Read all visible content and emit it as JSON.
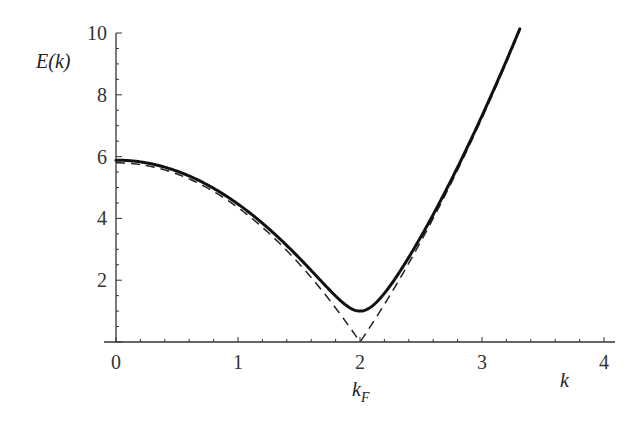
{
  "chart_data": {
    "type": "line",
    "title": "",
    "xlabel": "k",
    "ylabel": "E(k)",
    "xlim": [
      0,
      4
    ],
    "ylim": [
      0,
      10
    ],
    "x_ticks": [
      0,
      1,
      2,
      3,
      4
    ],
    "y_ticks": [
      2,
      4,
      6,
      8,
      10
    ],
    "x_minor_step": 0.2,
    "y_minor_step": 0.5,
    "annotations": [
      {
        "text": "k_F",
        "x": 2,
        "position": "below x-axis label 2"
      }
    ],
    "grid": false,
    "legend": null,
    "model": {
      "description": "Quasiparticle dispersion E(k)=sqrt(eps(k)^2+Delta^2), eps(k)=c*(k^2-kF^2)",
      "kF": 2,
      "c": 1.45,
      "Delta": 1.0
    },
    "series": [
      {
        "name": "E(k) gapped",
        "style": "solid",
        "x": [
          0,
          0.5,
          1.0,
          1.5,
          1.8,
          2.0,
          2.2,
          2.5,
          2.8,
          3.0,
          3.31
        ],
        "values": [
          5.89,
          5.51,
          4.46,
          2.73,
          1.66,
          1.0,
          1.66,
          3.42,
          5.63,
          7.32,
          10.1
        ]
      },
      {
        "name": "|eps(k)| normal",
        "style": "dashed",
        "x": [
          0,
          0.5,
          1.0,
          1.5,
          1.8,
          2.0,
          2.2,
          2.5,
          2.8,
          3.0,
          3.31
        ],
        "values": [
          5.8,
          5.44,
          4.35,
          2.54,
          1.1,
          0.0,
          1.22,
          3.26,
          5.57,
          7.25,
          10.09
        ]
      }
    ]
  },
  "labels": {
    "ylabel": "E(k)",
    "xlabel": "k",
    "kF_main": "k",
    "kF_sub": "F"
  }
}
